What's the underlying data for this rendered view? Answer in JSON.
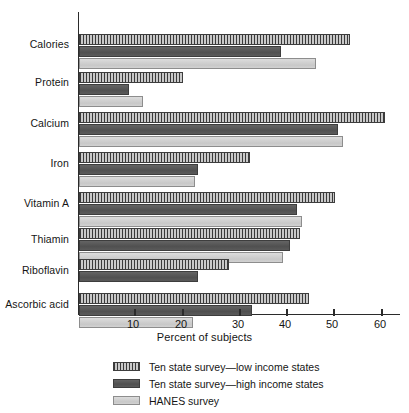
{
  "chart_data": {
    "type": "bar",
    "orientation": "horizontal",
    "title": "",
    "xlabel": "Percent of subjects",
    "ylabel": "",
    "xlim": [
      0,
      65
    ],
    "xticks": [
      10,
      20,
      30,
      40,
      50,
      60
    ],
    "grid": false,
    "legend_position": "bottom",
    "categories": [
      "Calories",
      "Protein",
      "Calcium",
      "Iron",
      "Vitamin A",
      "Thiamin",
      "Riboflavin",
      "Ascorbic acid"
    ],
    "series": [
      {
        "name": "Ten state survey—low income states",
        "style": "striped",
        "values": [
          55.5,
          20.5,
          63.0,
          34.5,
          52.5,
          45.0,
          30.0,
          47.0
        ]
      },
      {
        "name": "Ten state survey—high income states",
        "style": "dark",
        "values": [
          41.0,
          9.0,
          53.0,
          23.5,
          44.5,
          43.0,
          23.5,
          35.0
        ]
      },
      {
        "name": "HANES survey",
        "style": "light",
        "values": [
          48.5,
          12.0,
          54.0,
          23.0,
          45.5,
          41.5,
          null,
          22.5
        ]
      }
    ]
  },
  "axis": {
    "tick_labels": [
      "10",
      "20",
      "30",
      "40",
      "50",
      "60"
    ],
    "x_axis_title": "Percent of subjects"
  },
  "legend": {
    "entries": [
      {
        "label": "Ten state survey—low income states",
        "style": "striped"
      },
      {
        "label": "Ten state survey—high income states",
        "style": "dark"
      },
      {
        "label": "HANES survey",
        "style": "light"
      }
    ]
  },
  "colors": {
    "striped_dark": "#3a3a3a",
    "striped_light": "#c9c9c9",
    "dark_bar": "#585858",
    "light_bar": "#cfcfcf",
    "axis": "#2b2b2b",
    "text": "#151515",
    "background": "#ffffff"
  }
}
